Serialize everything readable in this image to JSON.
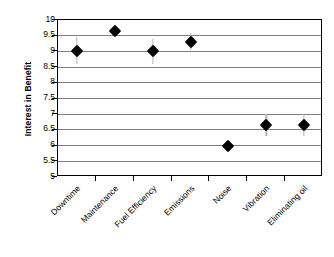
{
  "chart_data": {
    "type": "scatter",
    "title": "",
    "xlabel": "",
    "ylabel": "Interest in Benefit",
    "ylim": [
      5,
      10
    ],
    "yticks": [
      5,
      5.5,
      6,
      6.5,
      7,
      7.5,
      8,
      8.5,
      9,
      9.5,
      10
    ],
    "ytick_labels": [
      "5",
      "5.5",
      "6",
      "6.5",
      "7",
      "7.5",
      "8",
      "8.5",
      "9",
      "9.5",
      "10"
    ],
    "grid": "horizontal",
    "legend": "none",
    "marker": "filled-diamond",
    "marker_color": "#000000",
    "errorbar_color": "#b3b3b3",
    "categories": [
      "Downtime",
      "Maintenance",
      "Fuel Efficiency",
      "Emissions",
      "Noise",
      "Vibration",
      "Eliminating oil"
    ],
    "values": [
      9.0,
      9.65,
      9.0,
      9.3,
      6.0,
      6.65,
      6.65
    ],
    "error_low": [
      8.6,
      9.5,
      8.6,
      9.05,
      5.9,
      6.3,
      6.3
    ],
    "error_high": [
      9.45,
      9.8,
      9.4,
      9.6,
      6.1,
      7.0,
      7.0
    ],
    "points": [
      {
        "category": "Downtime",
        "value": 9.0,
        "low": 8.6,
        "high": 9.45
      },
      {
        "category": "Maintenance",
        "value": 9.65,
        "low": 9.5,
        "high": 9.8
      },
      {
        "category": "Fuel Efficiency",
        "value": 9.0,
        "low": 8.6,
        "high": 9.4
      },
      {
        "category": "Emissions",
        "value": 9.3,
        "low": 9.05,
        "high": 9.6
      },
      {
        "category": "Noise",
        "value": 6.0,
        "low": 5.9,
        "high": 6.1
      },
      {
        "category": "Vibration",
        "value": 6.65,
        "low": 6.3,
        "high": 7.0
      },
      {
        "category": "Eliminating oil",
        "value": 6.65,
        "low": 6.3,
        "high": 7.0
      }
    ]
  }
}
